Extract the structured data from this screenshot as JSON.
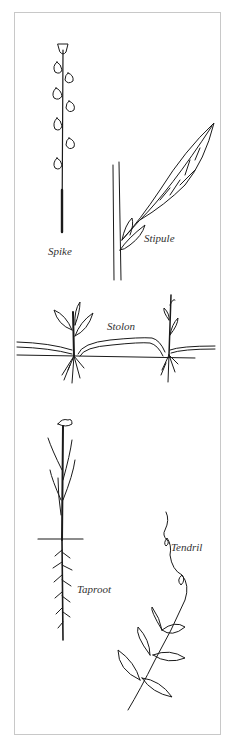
{
  "labels": {
    "spike": "Spike",
    "stipule": "Stipule",
    "stolon": "Stolon",
    "taproot": "Taproot",
    "tendril": "Tendril"
  },
  "colors": {
    "ink": "#1a1a1a",
    "border": "#c8c8c8",
    "background": "#ffffff"
  }
}
